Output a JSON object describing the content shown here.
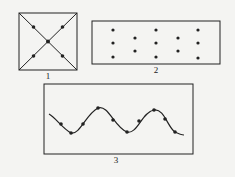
{
  "figures": [
    {
      "label": "1",
      "type": "square-with-diagonals",
      "dots": 5
    },
    {
      "label": "2",
      "type": "dot-grid-rectangle",
      "dots": 13
    },
    {
      "label": "3",
      "type": "sine-wave-with-dots",
      "dots": 10
    }
  ],
  "colors": {
    "stroke": "#222222",
    "background": "#f4f4f2"
  }
}
